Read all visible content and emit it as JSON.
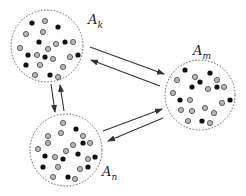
{
  "diagram": {
    "colors": {
      "dot_black": "#111111",
      "dot_gray_fill": "#b8b8b8",
      "dot_gray_stroke": "#444444",
      "circle_stroke": "#555555",
      "arrow": "#333333"
    },
    "nodes": [
      {
        "id": "Ak",
        "label_main": "A",
        "label_sub": "k",
        "cx": 47,
        "cy": 46,
        "r": 36,
        "label_x": 88,
        "label_y": 12,
        "dots": [
          [
            32,
            23,
            "b"
          ],
          [
            45,
            21,
            "g"
          ],
          [
            58,
            27,
            "b"
          ],
          [
            26,
            34,
            "g"
          ],
          [
            43,
            32,
            "g"
          ],
          [
            20,
            48,
            "g"
          ],
          [
            39,
            42,
            "b"
          ],
          [
            48,
            49,
            "g"
          ],
          [
            56,
            44,
            "g"
          ],
          [
            65,
            42,
            "b"
          ],
          [
            73,
            42,
            "g"
          ],
          [
            28,
            55,
            "b"
          ],
          [
            37,
            55,
            "g"
          ],
          [
            45,
            57,
            "b"
          ],
          [
            53,
            59,
            "g"
          ],
          [
            70,
            57,
            "g"
          ],
          [
            78,
            55,
            "b"
          ],
          [
            26,
            65,
            "b"
          ],
          [
            40,
            65,
            "g"
          ],
          [
            63,
            67,
            "g"
          ],
          [
            35,
            75,
            "g"
          ],
          [
            50,
            75,
            "b"
          ],
          [
            58,
            77,
            "g"
          ]
        ]
      },
      {
        "id": "Am",
        "label_main": "A",
        "label_sub": "m",
        "cx": 200,
        "cy": 95,
        "r": 35,
        "label_x": 193,
        "label_y": 43,
        "dots": [
          [
            185,
            70,
            "b"
          ],
          [
            210,
            73,
            "b"
          ],
          [
            177,
            80,
            "g"
          ],
          [
            195,
            77,
            "g"
          ],
          [
            200,
            82,
            "b"
          ],
          [
            217,
            80,
            "g"
          ],
          [
            192,
            87,
            "b"
          ],
          [
            208,
            89,
            "g"
          ],
          [
            217,
            87,
            "b"
          ],
          [
            224,
            87,
            "g"
          ],
          [
            173,
            93,
            "g"
          ],
          [
            180,
            100,
            "b"
          ],
          [
            190,
            100,
            "g"
          ],
          [
            222,
            103,
            "g"
          ],
          [
            230,
            100,
            "b"
          ],
          [
            181,
            110,
            "g"
          ],
          [
            192,
            111,
            "g"
          ],
          [
            205,
            108,
            "g"
          ],
          [
            214,
            113,
            "g"
          ],
          [
            188,
            121,
            "g"
          ],
          [
            202,
            121,
            "b"
          ],
          [
            210,
            123,
            "g"
          ]
        ]
      },
      {
        "id": "An",
        "label_main": "A",
        "label_sub": "n",
        "cx": 66,
        "cy": 150,
        "r": 36,
        "label_x": 102,
        "label_y": 164,
        "dots": [
          [
            63,
            123,
            "g"
          ],
          [
            76,
            129,
            "b"
          ],
          [
            48,
            136,
            "g"
          ],
          [
            61,
            133,
            "g"
          ],
          [
            83,
            136,
            "g"
          ],
          [
            48,
            143,
            "g"
          ],
          [
            73,
            145,
            "g"
          ],
          [
            83,
            143,
            "b"
          ],
          [
            90,
            143,
            "g"
          ],
          [
            38,
            149,
            "g"
          ],
          [
            66,
            151,
            "g"
          ],
          [
            45,
            156,
            "b"
          ],
          [
            55,
            157,
            "g"
          ],
          [
            63,
            159,
            "b"
          ],
          [
            78,
            154,
            "b"
          ],
          [
            88,
            159,
            "g"
          ],
          [
            95,
            157,
            "b"
          ],
          [
            43,
            167,
            "b"
          ],
          [
            58,
            167,
            "g"
          ],
          [
            80,
            169,
            "g"
          ],
          [
            88,
            167,
            "b"
          ],
          [
            53,
            177,
            "g"
          ],
          [
            68,
            177,
            "b"
          ],
          [
            75,
            179,
            "g"
          ]
        ]
      }
    ],
    "edges": [
      {
        "from": "Ak",
        "to": "Am",
        "x1": 90,
        "y1": 47,
        "x2": 164,
        "y2": 74
      },
      {
        "from": "Am",
        "to": "Ak",
        "x1": 160,
        "y1": 86,
        "x2": 91,
        "y2": 60
      },
      {
        "from": "An",
        "to": "Am",
        "x1": 103,
        "y1": 131,
        "x2": 162,
        "y2": 109
      },
      {
        "from": "Am",
        "to": "An",
        "x1": 163,
        "y1": 118,
        "x2": 108,
        "y2": 141
      },
      {
        "from": "Ak",
        "to": "An",
        "x1": 51,
        "y1": 84,
        "x2": 55,
        "y2": 112
      },
      {
        "from": "An",
        "to": "Ak",
        "x1": 64,
        "y1": 111,
        "x2": 60,
        "y2": 85
      }
    ]
  }
}
